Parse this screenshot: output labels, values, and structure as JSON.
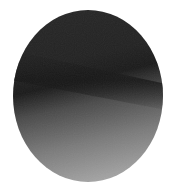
{
  "image": {
    "description": "Grayscale elliptical specimen photograph with a dark diagonal band across the upper-middle, lightening toward the bottom",
    "background_color": "#ffffff",
    "shape": {
      "type": "ellipse",
      "cx": 88,
      "cy": 96,
      "rx": 75,
      "ry": 86,
      "clip_top_y": 10
    },
    "colors": {
      "top": "#262626",
      "band": "#1a1a1a",
      "mid": "#4a4a4a",
      "lower": "#7a7a7a",
      "bottom": "#ababab"
    }
  }
}
